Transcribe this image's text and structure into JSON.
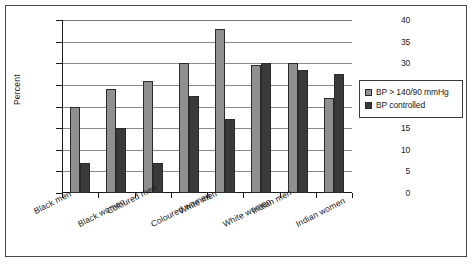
{
  "chart_data": {
    "type": "bar",
    "title": "",
    "subtitle": "",
    "xlabel": "",
    "ylabel": "Percent",
    "ylim": [
      0,
      40
    ],
    "ytick_step": 5,
    "yticks": [
      0,
      5,
      10,
      15,
      20,
      25,
      30,
      35,
      40
    ],
    "grid": "horizontal",
    "legend_position": "right",
    "categories": [
      "Black men",
      "Black women",
      "Coloured men",
      "Coloured women",
      "White men",
      "White women",
      "Indian men",
      "Indian women"
    ],
    "series": [
      {
        "name": "BP > 140/90 mmHg",
        "color": "#8f8f8f",
        "values": [
          20,
          24,
          26,
          30,
          38,
          29.5,
          30,
          22
        ]
      },
      {
        "name": "BP controlled",
        "color": "#3a3a3a",
        "values": [
          7,
          15,
          7,
          22.5,
          17,
          30,
          28.5,
          27.5
        ]
      }
    ]
  },
  "legend": {
    "items": [
      {
        "label": "BP > 140/90 mmHg",
        "swatch": "legend-swatch-light"
      },
      {
        "label": "BP controlled",
        "swatch": "legend-swatch-dark"
      }
    ]
  }
}
